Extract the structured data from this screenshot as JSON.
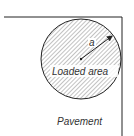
{
  "diagram": {
    "radius_label": "a",
    "loaded_area_label": "Loaded area",
    "pavement_label": "Pavement",
    "colors": {
      "line": "#222222",
      "hatch": "#555555",
      "background": "#ffffff"
    }
  }
}
